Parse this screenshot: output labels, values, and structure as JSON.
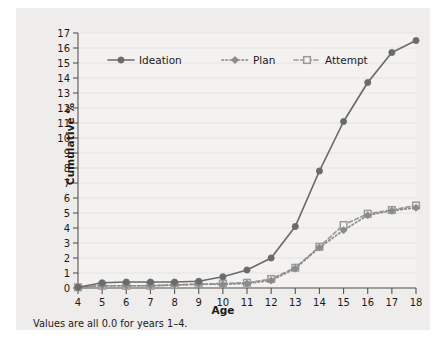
{
  "figure": {
    "footnote": "Values are all 0.0 for years 1–4.",
    "panel_bg": "#eeedeb",
    "page_bg": "#ffffff"
  },
  "chart_data": {
    "type": "line",
    "title": "",
    "xlabel": "Age",
    "ylabel": "Cumulative %",
    "x": [
      4,
      5,
      6,
      7,
      8,
      9,
      10,
      11,
      12,
      13,
      14,
      15,
      16,
      17,
      18
    ],
    "xlim": [
      4,
      18
    ],
    "ylim": [
      0,
      17
    ],
    "xticks": [
      "4",
      "5",
      "6",
      "7",
      "8",
      "9",
      "10",
      "11",
      "12",
      "13",
      "14",
      "15",
      "16",
      "17",
      "18"
    ],
    "yticks": [
      "0",
      "1",
      "2",
      "3",
      "4",
      "5",
      "6",
      "7",
      "8",
      "9",
      "10",
      "11",
      "12",
      "13",
      "14",
      "15",
      "16",
      "17"
    ],
    "grid": "horizontal",
    "legend_position": "top-left-inside",
    "series": [
      {
        "name": "Ideation",
        "color": "#6b6b6b",
        "linestyle": "solid",
        "marker": "circle",
        "values": [
          0.05,
          0.35,
          0.4,
          0.4,
          0.4,
          0.45,
          0.75,
          1.2,
          2.0,
          4.1,
          7.8,
          11.1,
          13.7,
          15.7,
          16.5
        ]
      },
      {
        "name": "Plan",
        "color": "#8a8a8a",
        "linestyle": "dotted",
        "marker": "diamond",
        "values": [
          0.05,
          0.15,
          0.15,
          0.15,
          0.2,
          0.25,
          0.25,
          0.3,
          0.5,
          1.3,
          2.7,
          3.85,
          4.85,
          5.15,
          5.35
        ]
      },
      {
        "name": "Attempt",
        "color": "#9a9a9a",
        "linestyle": "dashed",
        "marker": "open-square",
        "values": [
          0.05,
          0.15,
          0.15,
          0.15,
          0.2,
          0.25,
          0.3,
          0.35,
          0.6,
          1.35,
          2.75,
          4.2,
          4.95,
          5.2,
          5.5
        ]
      }
    ]
  }
}
